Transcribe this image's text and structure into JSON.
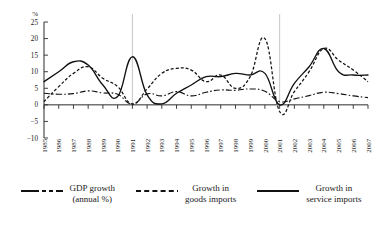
{
  "chart_data": {
    "type": "line",
    "title": "",
    "xlabel": "",
    "ylabel": "%",
    "ylim": [
      -10,
      25
    ],
    "yticks": [
      25,
      20,
      15,
      10,
      5,
      0,
      -5,
      -10
    ],
    "ytick_labels": [
      "25",
      "20",
      "15",
      "10",
      "5",
      "0",
      "−5",
      "−10"
    ],
    "grid": false,
    "legend_position": "bottom",
    "reference_lines": [
      1991,
      2001
    ],
    "categories": [
      1985,
      1986,
      1987,
      1988,
      1989,
      1990,
      1991,
      1992,
      1993,
      1994,
      1995,
      1996,
      1997,
      1998,
      1999,
      2000,
      2001,
      2002,
      2003,
      2004,
      2005,
      2006,
      2007
    ],
    "x_tick_labels": [
      "1985",
      "1986",
      "1987",
      "1988",
      "1989",
      "1990",
      "1991",
      "1992",
      "1993",
      "1994",
      "1995",
      "1996",
      "1997",
      "1998",
      "1999",
      "2000",
      "2001",
      "2002",
      "2003",
      "2004",
      "2005",
      "2006",
      "2007"
    ],
    "series": [
      {
        "name": "GDP growth (annual %)",
        "style": "dash-dot",
        "values": [
          3.5,
          3.2,
          3.4,
          4.2,
          3.6,
          3.2,
          0.2,
          3.3,
          2.7,
          4.0,
          2.7,
          3.8,
          4.5,
          4.4,
          4.8,
          4.1,
          1.0,
          1.8,
          2.8,
          3.8,
          3.4,
          2.7,
          2.2
        ]
      },
      {
        "name": "Growth in goods imports",
        "style": "dashed",
        "values": [
          1.0,
          5.5,
          9.5,
          11.5,
          8.0,
          5.5,
          0.3,
          4.8,
          9.5,
          11.0,
          10.5,
          7.0,
          9.0,
          5.0,
          8.5,
          20.0,
          -2.0,
          4.0,
          10.0,
          17.0,
          13.5,
          10.5,
          7.0
        ]
      },
      {
        "name": "Growth in service imports",
        "style": "solid",
        "values": [
          7.0,
          10.0,
          13.0,
          12.0,
          6.0,
          2.5,
          14.5,
          3.0,
          0.3,
          3.5,
          6.0,
          8.5,
          8.5,
          9.5,
          9.0,
          9.5,
          0.0,
          6.5,
          11.5,
          17.0,
          10.0,
          9.0,
          9.0
        ]
      }
    ]
  },
  "legend": {
    "items": [
      {
        "style": "dash-dot",
        "line1": "GDP growth",
        "line2": "(annual %)"
      },
      {
        "style": "dashed",
        "line1": "Growth in",
        "line2": "goods imports"
      },
      {
        "style": "solid",
        "line1": "Growth in",
        "line2": "service imports"
      }
    ]
  },
  "colors": {
    "line": "#111111",
    "axis": "#2b2b2b",
    "reference_line": "#b9b9b9",
    "background": "#ffffff"
  }
}
